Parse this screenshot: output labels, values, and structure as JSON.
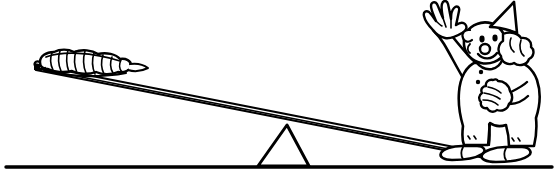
{
  "image": {
    "title": "Clown on a seesaw lever with a caterpillar",
    "style": "black-and-white line art, coloring-book outline",
    "width_px": 558,
    "height_px": 181,
    "background_color": "#ffffff",
    "ink_color": "#000000"
  },
  "scene": {
    "ground": {
      "label": "ground line",
      "y_px": 167,
      "x_start_px": 6,
      "x_end_px": 552,
      "stroke_width_px": 3
    },
    "fulcrum": {
      "label": "triangular fulcrum",
      "shape": "triangle",
      "apex_x_px": 287,
      "apex_y_px": 124,
      "base_left_x_px": 257,
      "base_right_x_px": 310,
      "base_y_px": 166
    },
    "plank": {
      "label": "seesaw plank",
      "left_end_x_px": 36,
      "left_end_y_px": 68,
      "right_end_x_px": 500,
      "right_end_y_px": 160,
      "thickness_px": 5,
      "description": "long thin board tilted down to the right, drawn with parallel top and bottom edges"
    },
    "caterpillar": {
      "label": "caterpillar",
      "position": "left raised end of plank",
      "center_x_px": 85,
      "center_y_px": 62,
      "length_px": 95,
      "segment_count": 9,
      "description": "segmented grub lying along the raised end of the board"
    },
    "clown": {
      "label": "clown",
      "position": "right lowered end of plank",
      "pose": "standing, left arm raised waving",
      "x_px": 415,
      "y_px": 2,
      "width_px": 140,
      "height_px": 160,
      "parts": [
        {
          "name": "pointed-hat",
          "label": "pointed party hat"
        },
        {
          "name": "puffy-hair",
          "label": "puffy side hair"
        },
        {
          "name": "face",
          "label": "face with round nose"
        },
        {
          "name": "eyes",
          "label": "two dot eyes"
        },
        {
          "name": "nose",
          "label": "round nose"
        },
        {
          "name": "mouth",
          "label": "smiling mouth"
        },
        {
          "name": "waving-hand",
          "label": "raised waving hand"
        },
        {
          "name": "lower-hand",
          "label": "lowered gloved hand"
        },
        {
          "name": "ruffle-collar",
          "label": "neck ruffle"
        },
        {
          "name": "pom-poms",
          "label": "costume pom-pom buttons"
        },
        {
          "name": "baggy-suit",
          "label": "baggy clown suit"
        },
        {
          "name": "big-shoes",
          "label": "big clown shoes"
        }
      ]
    }
  },
  "alt_text": "Line drawing of a lever: a small caterpillar sits on the high left end of a long board balanced on a triangular fulcrum, while a waving clown stands on the low right end which rests on the ground."
}
